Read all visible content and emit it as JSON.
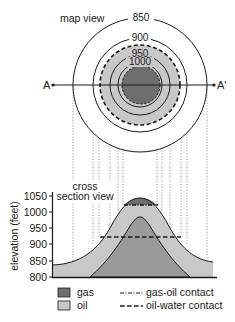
{
  "map": {
    "title": "map view",
    "center": [
      140,
      85
    ],
    "contours": [
      {
        "label": "850",
        "r": 67
      },
      {
        "label": "900",
        "r": 47
      },
      {
        "label": "950",
        "r": 30
      },
      {
        "label": "1000",
        "r": 22
      }
    ],
    "oil_water_r": 40,
    "gas_r": 19,
    "section_start": "A",
    "section_end": "A'"
  },
  "cross_section": {
    "title_line1": "cross",
    "title_line2": "section view",
    "y_axis_label": "elevation (feet)",
    "y_ticks": [
      "1050",
      "1000",
      "950",
      "900",
      "850",
      "800"
    ]
  },
  "legend": {
    "gas": "gas",
    "oil": "oil",
    "gas_oil_contact": "gas-oil contact",
    "oil_water_contact": "oil-water contact"
  },
  "colors": {
    "gas": "#6e6e6e",
    "oil": "#c8c8c8",
    "rock": "#9a9a9a",
    "line": "#1a1a1a"
  }
}
